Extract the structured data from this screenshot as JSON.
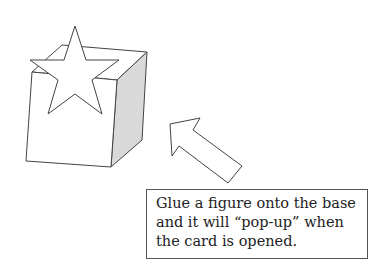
{
  "diagram": {
    "figure": {
      "shape": "star",
      "label": "pop-up figure"
    },
    "base": {
      "shape": "box",
      "shade_color": "#d9d9d9",
      "stroke_color": "#444444"
    },
    "arrow": {
      "direction": "up-left",
      "points_to": "base"
    }
  },
  "caption": {
    "lines": [
      "Glue a figure onto the base",
      "and it will “pop-up” when",
      "the card is opened."
    ]
  }
}
